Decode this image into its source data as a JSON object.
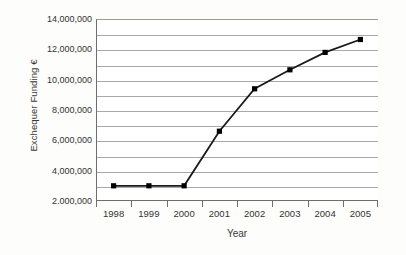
{
  "chart_data": {
    "type": "line",
    "title": "",
    "xlabel": "Year",
    "ylabel": "Exchequer Funding €",
    "categories": [
      "1998",
      "1999",
      "2000",
      "2001",
      "2002",
      "2003",
      "2004",
      "2005"
    ],
    "values": [
      3000000,
      3000000,
      3000000,
      6600000,
      9400000,
      10650000,
      11800000,
      12650000
    ],
    "series": [
      {
        "name": "Exchequer Funding",
        "values": [
          3000000,
          3000000,
          3000000,
          6600000,
          9400000,
          10650000,
          11800000,
          12650000
        ]
      }
    ],
    "ylim": [
      2000000,
      14000000
    ],
    "ytick_values": [
      2000000,
      3000000,
      4000000,
      5000000,
      6000000,
      7000000,
      8000000,
      9000000,
      10000000,
      11000000,
      12000000,
      13000000,
      14000000
    ],
    "ytick_labels": [
      {
        "value": 14000000,
        "label": "14,000,000"
      },
      {
        "value": 12000000,
        "label": "12,000,000"
      },
      {
        "value": 10000000,
        "label": "10,000,000"
      },
      {
        "value": 8000000,
        "label": "8,000,000"
      },
      {
        "value": 6000000,
        "label": "6,000,000"
      },
      {
        "value": 4000000,
        "label": "4,000,000"
      },
      {
        "value": 2000000,
        "label": "2.000,000"
      }
    ],
    "grid": true,
    "legend": "none",
    "line_color": "#1a1a1a",
    "marker": "square",
    "marker_color": "#000000",
    "gridline_color": "#a8a8a8",
    "axis_color": "#6d6d6d",
    "background": "#ffffff"
  }
}
